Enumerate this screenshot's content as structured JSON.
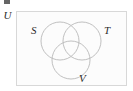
{
  "figure": {
    "name": "venn-diagram-three-sets",
    "background_color": "#ffffff",
    "artifact_note": "",
    "universe": {
      "label": "U",
      "border_color": "#d8d8d8",
      "fill_color": "#fcfcfc",
      "rect": {
        "x": 16,
        "y": 11,
        "width": 111,
        "height": 75
      }
    },
    "circles": [
      {
        "label": "S",
        "name": "circle-s",
        "cx": 60,
        "cy": 41,
        "r": 19,
        "stroke": "#b9b9b9",
        "label_pos": {
          "x": 31,
          "y": 25
        }
      },
      {
        "label": "T",
        "name": "circle-t",
        "cx": 82,
        "cy": 41,
        "r": 19,
        "stroke": "#b9b9b9",
        "label_pos": {
          "x": 104,
          "y": 25
        }
      },
      {
        "label": "V",
        "name": "circle-v",
        "cx": 71,
        "cy": 60,
        "r": 19,
        "stroke": "#b9b9b9",
        "label_pos": {
          "x": 79,
          "y": 73
        }
      }
    ],
    "stroke_width": 0.9
  }
}
